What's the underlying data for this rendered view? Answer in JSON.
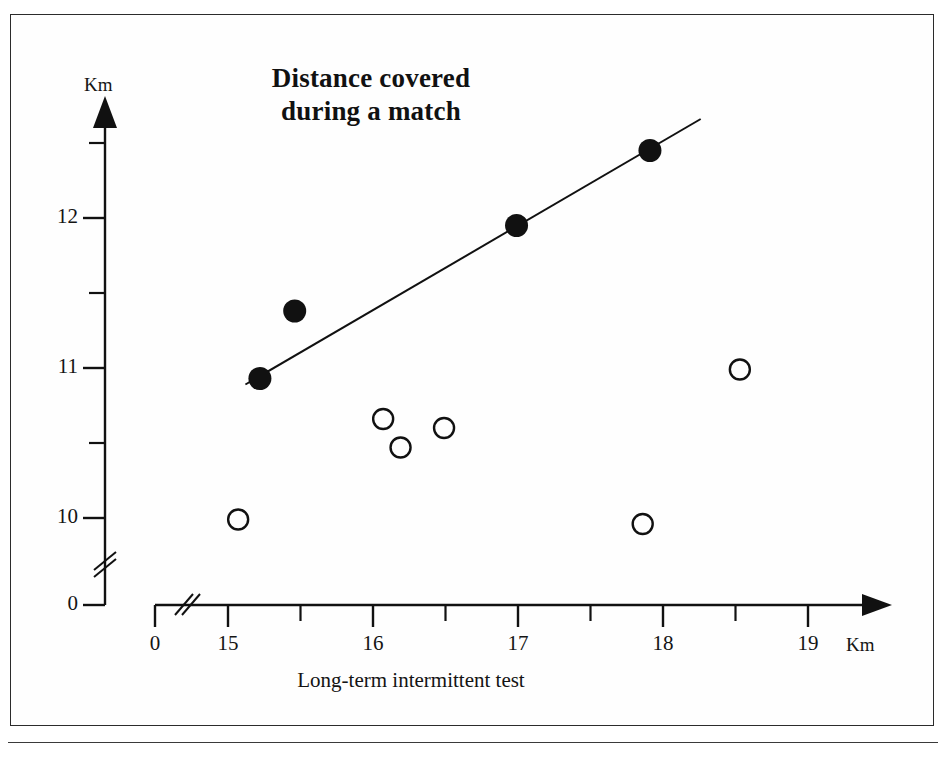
{
  "figure": {
    "title_line1": "Distance covered",
    "title_line2": "during a match",
    "x_axis_title": "Long-term intermittent test",
    "y_axis_unit": "Km",
    "x_axis_unit": "Km"
  },
  "chart_data": {
    "type": "scatter",
    "title": "Distance covered during a match",
    "xlabel": "Long-term intermittent test",
    "ylabel": "Km",
    "x_unit": "Km",
    "y_unit": "Km",
    "grid": false,
    "legend": "none",
    "xlim": [
      15,
      19
    ],
    "ylim": [
      10,
      12.5
    ],
    "x_axis_break": true,
    "y_axis_break": true,
    "x_ticks_labeled": [
      "0",
      "15",
      "16",
      "17",
      "18",
      "19"
    ],
    "x_tick_values": [
      0,
      15,
      16,
      17,
      18,
      19
    ],
    "x_minor_ticks": [
      15.5,
      16.5,
      17.5,
      18.5
    ],
    "y_ticks_labeled": [
      "0",
      "10",
      "11",
      "12"
    ],
    "y_tick_values": [
      0,
      10,
      11,
      12
    ],
    "y_minor_ticks": [
      10.5,
      11.5,
      12.5
    ],
    "series": [
      {
        "name": "mean values (filled)",
        "marker": "filled-circle",
        "color": "#111111",
        "points": [
          {
            "x": 15.22,
            "y": 10.93
          },
          {
            "x": 15.46,
            "y": 11.38
          },
          {
            "x": 16.99,
            "y": 11.95
          },
          {
            "x": 17.91,
            "y": 12.45
          }
        ]
      },
      {
        "name": "individual values (open)",
        "marker": "open-circle",
        "color": "#111111",
        "points": [
          {
            "x": 15.07,
            "y": 9.99
          },
          {
            "x": 16.07,
            "y": 10.66
          },
          {
            "x": 16.19,
            "y": 10.47
          },
          {
            "x": 16.49,
            "y": 10.6
          },
          {
            "x": 17.86,
            "y": 9.96
          },
          {
            "x": 18.53,
            "y": 10.99
          }
        ]
      }
    ],
    "trendline": {
      "name": "regression line",
      "x_start": 15.12,
      "y_start": 10.89,
      "x_end": 18.26,
      "y_end": 12.66
    }
  }
}
